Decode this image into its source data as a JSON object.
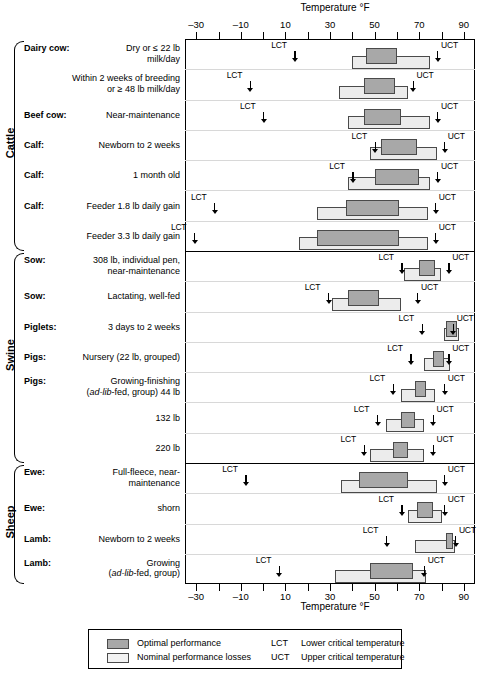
{
  "chart_data": {
    "type": "bar",
    "title": "Temperature °F",
    "xlabel": "Temperature °F",
    "ylabel": "",
    "xlim": [
      -35,
      95
    ],
    "xticks": [
      -30,
      -20,
      -10,
      0,
      10,
      20,
      30,
      40,
      50,
      60,
      70,
      80,
      90
    ],
    "xticklabels_shown": [
      "-30",
      "-10",
      "10",
      "30",
      "50",
      "70",
      "90"
    ],
    "grid": false,
    "legend_position": "bottom",
    "units": "°F",
    "groups": [
      {
        "name": "Cattle",
        "rows": [
          {
            "lead": "Dairy cow:",
            "detail": "Dry or ≤ 22 lb milk/day",
            "lct": 14,
            "uct": 78,
            "nominal": [
              40,
              75
            ],
            "optimal": [
              46,
              60
            ]
          },
          {
            "lead": "",
            "detail": "Within 2 weeks of breeding or ≥ 48 lb milk/day",
            "lct": -6,
            "uct": 67,
            "nominal": [
              34,
              65
            ],
            "optimal": [
              45,
              59
            ]
          },
          {
            "lead": "Beef cow:",
            "detail": "Near-maintenance",
            "lct": 0,
            "uct": 78,
            "nominal": [
              38,
              75
            ],
            "optimal": [
              45,
              62
            ]
          },
          {
            "lead": "Calf:",
            "detail": "Newborn to 2 weeks",
            "lct": 50,
            "uct": 81,
            "nominal": [
              48,
              78
            ],
            "optimal": [
              53,
              69
            ]
          },
          {
            "lead": "Calf:",
            "detail": "1 month old",
            "lct": 40,
            "uct": 78,
            "nominal": [
              38,
              75
            ],
            "optimal": [
              50,
              70
            ]
          },
          {
            "lead": "Calf:",
            "detail": "Feeder 1.8 lb daily gain",
            "lct": -22,
            "uct": 77,
            "nominal": [
              24,
              74
            ],
            "optimal": [
              37,
              61
            ]
          },
          {
            "lead": "",
            "detail": "Feeder 3.3 lb daily gain",
            "lct": -31,
            "uct": 77,
            "nominal": [
              16,
              74
            ],
            "optimal": [
              24,
              61
            ]
          }
        ]
      },
      {
        "name": "Swine",
        "rows": [
          {
            "lead": "Sow:",
            "detail": "308 lb, individual pen, near-maintenance",
            "lct": 62,
            "uct": 83,
            "nominal": [
              63,
              80
            ],
            "optimal": [
              70,
              77
            ]
          },
          {
            "lead": "Sow:",
            "detail": "Lactating, well-fed",
            "lct": 29,
            "uct": 69,
            "nominal": [
              31,
              62
            ],
            "optimal": [
              38,
              52
            ]
          },
          {
            "lead": "Piglets:",
            "detail": "3 days to 2 weeks",
            "lct": 71,
            "uct": 85,
            "nominal": [
              81,
              88
            ],
            "optimal": [
              82,
              87
            ]
          },
          {
            "lead": "Pigs:",
            "detail": "Nursery (22 lb, grouped)",
            "lct": 66,
            "uct": 83,
            "nominal": [
              72,
              84
            ],
            "optimal": [
              76,
              81
            ]
          },
          {
            "lead": "Pigs:",
            "detail": "Growing-finishing (ad-lib-fed, group) 44 lb",
            "lct": 58,
            "uct": 81,
            "nominal": [
              62,
              77
            ],
            "optimal": [
              68,
              73
            ]
          },
          {
            "lead": "",
            "detail": "132 lb",
            "lct": 51,
            "uct": 76,
            "nominal": [
              55,
              72
            ],
            "optimal": [
              62,
              68
            ]
          },
          {
            "lead": "",
            "detail": "220 lb",
            "lct": 45,
            "uct": 76,
            "nominal": [
              48,
              72
            ],
            "optimal": [
              58,
              65
            ]
          }
        ]
      },
      {
        "name": "Sheep",
        "rows": [
          {
            "lead": "Ewe:",
            "detail": "Full-fleece, near-maintenance",
            "lct": -8,
            "uct": 81,
            "nominal": [
              35,
              78
            ],
            "optimal": [
              43,
              65
            ]
          },
          {
            "lead": "Ewe:",
            "detail": "shorn",
            "lct": 62,
            "uct": 81,
            "nominal": [
              65,
              80
            ],
            "optimal": [
              69,
              76
            ]
          },
          {
            "lead": "Lamb:",
            "detail": "Newborn to 2 weeks",
            "lct": 55,
            "uct": 86,
            "nominal": [
              68,
              86
            ],
            "optimal": [
              82,
              85
            ]
          },
          {
            "lead": "Lamb:",
            "detail": "Growing (ad-lib-fed, group)",
            "lct": 7,
            "uct": 72,
            "nominal": [
              32,
              73
            ],
            "optimal": [
              48,
              67
            ]
          }
        ]
      }
    ]
  },
  "axis": {
    "title_top": "Temperature °F",
    "title_bottom": "Temperature °F",
    "labels": [
      "–30",
      "–10",
      "10",
      "30",
      "50",
      "70",
      "90"
    ]
  },
  "legend": {
    "optimal_label": "Optimal performance",
    "nominal_label": "Nominal performance losses",
    "lct_abbr": "LCT",
    "lct_label": "Lower critical temperature",
    "uct_abbr": "UCT",
    "uct_label": "Upper critical temperature"
  },
  "marker_text": {
    "lct": "LCT",
    "uct": "UCT"
  },
  "row_labels": [
    {
      "lead": "Dairy cow:",
      "line1": "Dry or ≤ 22 lb",
      "line2": "milk/day"
    },
    {
      "lead": "",
      "line1": "Within 2 weeks of breeding",
      "line2": "or ≥ 48 lb milk/day"
    },
    {
      "lead": "Beef cow:",
      "line1": "Near-maintenance",
      "line2": ""
    },
    {
      "lead": "Calf:",
      "line1": "Newborn to 2 weeks",
      "line2": ""
    },
    {
      "lead": "Calf:",
      "line1": "1 month old",
      "line2": ""
    },
    {
      "lead": "Calf:",
      "line1": "Feeder 1.8 lb daily gain",
      "line2": ""
    },
    {
      "lead": "",
      "line1": "Feeder 3.3 lb daily gain",
      "line2": ""
    },
    {
      "lead": "Sow:",
      "line1": "308 lb, individual pen,",
      "line2": "near-maintenance"
    },
    {
      "lead": "Sow:",
      "line1": "Lactating, well-fed",
      "line2": ""
    },
    {
      "lead": "Piglets:",
      "line1": "3 days to 2 weeks",
      "line2": ""
    },
    {
      "lead": "Pigs:",
      "line1": "Nursery (22 lb, grouped)",
      "line2": ""
    },
    {
      "lead": "Pigs:",
      "line1": "Growing-finishing",
      "line2": "(ad-lib-fed, group)  44 lb"
    },
    {
      "lead": "",
      "line1": "132 lb",
      "line2": ""
    },
    {
      "lead": "",
      "line1": "220 lb",
      "line2": ""
    },
    {
      "lead": "Ewe:",
      "line1": "Full-fleece, near-",
      "line2": "maintenance"
    },
    {
      "lead": "Ewe:",
      "line1": "shorn",
      "line2": ""
    },
    {
      "lead": "Lamb:",
      "line1": "Newborn to 2 weeks",
      "line2": ""
    },
    {
      "lead": "Lamb:",
      "line1": "Growing",
      "line2": "(ad-lib-fed, group)"
    }
  ],
  "group_names": [
    "Cattle",
    "Swine",
    "Sheep"
  ],
  "colors": {
    "optimal_fill": "#a8a8a8",
    "nominal_fill": "#ececec",
    "bar_stroke": "#4a4a4a",
    "axis": "#000000",
    "rowline": "#d8d8d8"
  }
}
